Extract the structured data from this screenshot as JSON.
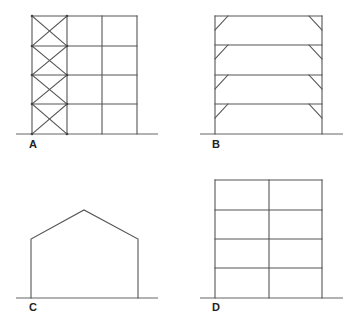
{
  "figures": [
    {
      "id": "A",
      "label": "A",
      "description": "Three-bay, four-storey frame with cross bracing in the left bay"
    },
    {
      "id": "B",
      "label": "B",
      "description": "Single-bay, four-storey frame with knee braces at each beam-column joint"
    },
    {
      "id": "C",
      "label": "C",
      "description": "Single-storey portal frame with pitched roof"
    },
    {
      "id": "D",
      "label": "D",
      "description": "Two-bay, four-storey rigid frame"
    }
  ],
  "colors": {
    "line": "#555555",
    "ground": "#666666",
    "label": "#222222",
    "background": "#ffffff"
  }
}
